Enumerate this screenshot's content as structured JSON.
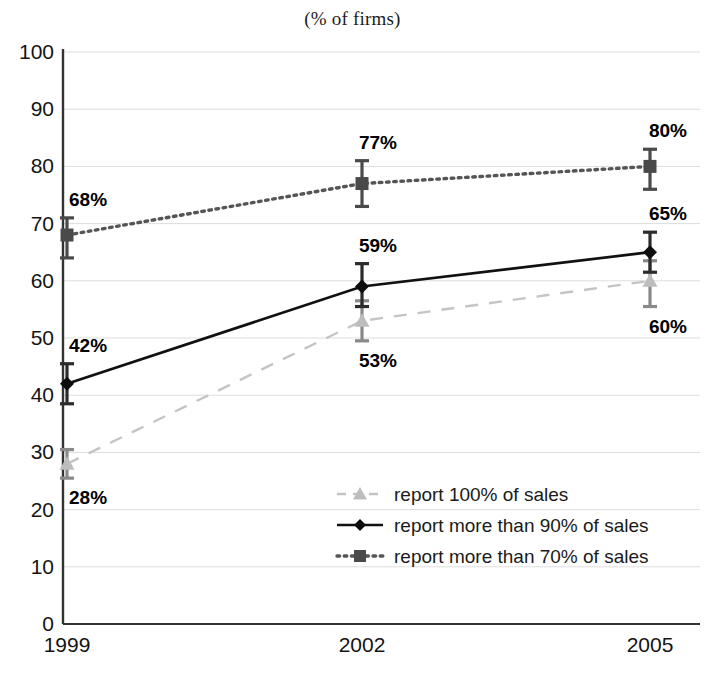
{
  "chart_data": {
    "type": "line",
    "title": "(% of firms)",
    "xlabel": "",
    "ylabel": "",
    "categories": [
      "1999",
      "2002",
      "2005"
    ],
    "x": [
      1999,
      2002,
      2005
    ],
    "ylim": [
      0,
      100
    ],
    "y_ticks": [
      0,
      10,
      20,
      30,
      40,
      50,
      60,
      70,
      80,
      90,
      100
    ],
    "grid": true,
    "legend_position": "bottom-right",
    "series": [
      {
        "name": "report 100% of sales",
        "marker": "triangle",
        "line_style": "dashed",
        "color": "#c4c4c4",
        "values": [
          28,
          53,
          60
        ],
        "labels": [
          "28%",
          "53%",
          "60%"
        ],
        "label_position": [
          "below",
          "below",
          "below"
        ],
        "error_low": [
          25.5,
          49.5,
          55.5
        ],
        "error_high": [
          30.5,
          56.5,
          63.5
        ]
      },
      {
        "name": "report more than 90% of sales",
        "marker": "diamond",
        "line_style": "solid",
        "color": "#111111",
        "values": [
          42,
          59,
          65
        ],
        "labels": [
          "42%",
          "59%",
          "65%"
        ],
        "label_position": [
          "above",
          "above",
          "above"
        ],
        "error_low": [
          38.5,
          55.5,
          61.5
        ],
        "error_high": [
          45.5,
          63.0,
          68.5
        ]
      },
      {
        "name": "report more than 70% of sales",
        "marker": "square",
        "line_style": "dotted",
        "color": "#555555",
        "values": [
          68,
          77,
          80
        ],
        "labels": [
          "68%",
          "77%",
          "80%"
        ],
        "label_position": [
          "above",
          "above",
          "above"
        ],
        "error_low": [
          64.0,
          73.0,
          76.0
        ],
        "error_high": [
          71.0,
          81.0,
          83.0
        ]
      }
    ]
  },
  "axis": {
    "y_tick_labels": [
      "0",
      "10",
      "20",
      "30",
      "40",
      "50",
      "60",
      "70",
      "80",
      "90",
      "100"
    ],
    "x_tick_labels": [
      "1999",
      "2002",
      "2005"
    ]
  },
  "legend": {
    "entries": [
      {
        "label": "report 100% of sales"
      },
      {
        "label": "report more than 90% of sales"
      },
      {
        "label": "report more than 70% of sales"
      }
    ]
  }
}
